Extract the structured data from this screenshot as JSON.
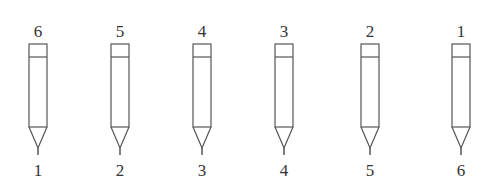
{
  "diagram": {
    "pencils": [
      {
        "top_label": "6",
        "bottom_label": "1",
        "x": 18
      },
      {
        "top_label": "5",
        "bottom_label": "2",
        "x": 100
      },
      {
        "top_label": "4",
        "bottom_label": "3",
        "x": 182
      },
      {
        "top_label": "3",
        "bottom_label": "4",
        "x": 264
      },
      {
        "top_label": "2",
        "bottom_label": "5",
        "x": 350
      },
      {
        "top_label": "1",
        "bottom_label": "6",
        "x": 441
      }
    ],
    "stroke_color": "#555555"
  }
}
